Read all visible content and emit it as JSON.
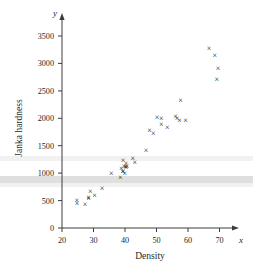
{
  "figure": {
    "background_color": "#ffffff",
    "ink_color": "#1a1a1a",
    "axis_color": "#3c3c3c"
  },
  "axes": {
    "y_variable_symbol": "y",
    "x_variable_symbol": "x",
    "x_axis_title": "Density",
    "y_axis_title": "Janka hardness",
    "x_ticks": [
      "20",
      "30",
      "40",
      "50",
      "60",
      "70"
    ],
    "y_ticks": [
      "0",
      "500",
      "1000",
      "1500",
      "2000",
      "2500",
      "3000",
      "3500"
    ]
  },
  "chart_data": {
    "type": "scatter",
    "title": "",
    "xlabel": "Density",
    "ylabel": "Janka hardness",
    "xlim": [
      20,
      72
    ],
    "ylim": [
      0,
      3700
    ],
    "xticks": [
      20,
      30,
      40,
      50,
      60,
      70
    ],
    "yticks": [
      0,
      500,
      1000,
      1500,
      2000,
      2500,
      3000,
      3500
    ],
    "grid": false,
    "legend": false,
    "marker": "x",
    "marker_color": "#121212",
    "n_points": 36,
    "x": [
      24.7,
      24.8,
      27.3,
      28.4,
      28.4,
      29.0,
      30.3,
      32.7,
      35.6,
      38.5,
      38.8,
      39.3,
      39.4,
      39.9,
      40.3,
      39.4,
      39.7,
      40.2,
      40.3,
      40.6,
      42.5,
      43.1,
      46.7,
      47.8,
      49.0,
      50.2,
      51.5,
      51.5,
      53.4,
      56.0,
      56.5,
      57.3,
      57.6,
      59.2,
      66.7,
      68.5,
      69.1,
      69.5
    ],
    "y": [
      484,
      427,
      413,
      517,
      549,
      648,
      587,
      704,
      979,
      914,
      1070,
      1020,
      1210,
      989,
      1160,
      1010,
      1100,
      1110,
      1090,
      1100,
      1260,
      1180,
      1400,
      1760,
      1710,
      2010,
      1880,
      1980,
      1820,
      2020,
      1980,
      1940,
      2310,
      1940,
      3260,
      3140,
      2700,
      2890
    ],
    "points": [
      {
        "x": 24.7,
        "y": 484
      },
      {
        "x": 24.8,
        "y": 427
      },
      {
        "x": 27.3,
        "y": 413
      },
      {
        "x": 28.4,
        "y": 517
      },
      {
        "x": 28.4,
        "y": 549
      },
      {
        "x": 29.0,
        "y": 648
      },
      {
        "x": 30.3,
        "y": 587
      },
      {
        "x": 32.7,
        "y": 704
      },
      {
        "x": 35.6,
        "y": 979
      },
      {
        "x": 38.5,
        "y": 914
      },
      {
        "x": 38.8,
        "y": 1070
      },
      {
        "x": 39.3,
        "y": 1020
      },
      {
        "x": 39.4,
        "y": 1210
      },
      {
        "x": 39.9,
        "y": 989
      },
      {
        "x": 40.3,
        "y": 1160
      },
      {
        "x": 39.4,
        "y": 1010
      },
      {
        "x": 39.7,
        "y": 1100
      },
      {
        "x": 40.2,
        "y": 1110
      },
      {
        "x": 40.3,
        "y": 1090
      },
      {
        "x": 40.6,
        "y": 1100
      },
      {
        "x": 42.5,
        "y": 1260
      },
      {
        "x": 43.1,
        "y": 1180
      },
      {
        "x": 46.7,
        "y": 1400
      },
      {
        "x": 47.8,
        "y": 1760
      },
      {
        "x": 49.0,
        "y": 1710
      },
      {
        "x": 50.2,
        "y": 2010
      },
      {
        "x": 51.5,
        "y": 1880
      },
      {
        "x": 51.5,
        "y": 1980
      },
      {
        "x": 53.4,
        "y": 1820
      },
      {
        "x": 56.0,
        "y": 2020
      },
      {
        "x": 56.5,
        "y": 1980
      },
      {
        "x": 57.3,
        "y": 1940
      },
      {
        "x": 57.6,
        "y": 2310
      },
      {
        "x": 59.2,
        "y": 1940
      },
      {
        "x": 66.7,
        "y": 3260
      },
      {
        "x": 68.5,
        "y": 3140
      },
      {
        "x": 69.1,
        "y": 2700
      },
      {
        "x": 69.5,
        "y": 2890
      }
    ]
  }
}
